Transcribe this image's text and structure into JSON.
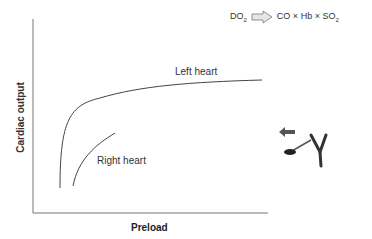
{
  "formula": {
    "lhs": "DO",
    "lhs_sub": "2",
    "rhs_parts": [
      "CO",
      "Hb",
      "SO"
    ],
    "rhs_sub": "2",
    "operator": "×"
  },
  "axes": {
    "x_label": "Preload",
    "y_label": "Cardiac output"
  },
  "curves": {
    "left_label": "Left heart",
    "right_label": "Right heart"
  },
  "colors": {
    "axis": "#777777",
    "curve": "#444444",
    "arrow_fill": "#e0e0e0"
  }
}
